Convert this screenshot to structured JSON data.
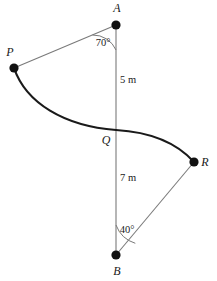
{
  "diagram": {
    "background_color": "#ffffff",
    "stroke_color": "#1a1a1a",
    "thin_stroke_color": "#6b6b6b",
    "points": [
      {
        "id": "A",
        "label": "A",
        "x": 116,
        "y": 25,
        "label_x": 117,
        "label_y": 12
      },
      {
        "id": "P",
        "label": "P",
        "x": 14,
        "y": 68,
        "label_x": 10,
        "label_y": 56
      },
      {
        "id": "Q",
        "label": "Q",
        "x": 116,
        "y": 130,
        "label_x": 106,
        "label_y": 144
      },
      {
        "id": "R",
        "label": "R",
        "x": 194,
        "y": 162,
        "label_x": 205,
        "label_y": 166
      },
      {
        "id": "B",
        "label": "B",
        "x": 116,
        "y": 255,
        "label_x": 117,
        "label_y": 275
      }
    ],
    "dimensions": [
      {
        "id": "AQ",
        "label": "5 m",
        "value": 5,
        "unit": "m",
        "x": 120,
        "y": 83
      },
      {
        "id": "QB",
        "label": "7 m",
        "value": 7,
        "unit": "m",
        "x": 120,
        "y": 181
      }
    ],
    "angles": [
      {
        "id": "angle-at-A",
        "label": "70°",
        "value": 70,
        "unit": "degree",
        "vertex": "A",
        "x": 103,
        "y": 46
      },
      {
        "id": "angle-at-B",
        "label": "40°",
        "value": 40,
        "unit": "degree",
        "vertex": "B",
        "x": 127,
        "y": 233
      }
    ],
    "segments": [
      {
        "id": "segment-AB",
        "from": "A",
        "to": "B",
        "style": "thin"
      },
      {
        "id": "segment-PA",
        "from": "P",
        "to": "A",
        "style": "thin"
      },
      {
        "id": "segment-BR",
        "from": "B",
        "to": "R",
        "style": "thin"
      }
    ],
    "curve": {
      "id": "reverse-curve-PQR",
      "from": "P",
      "through": "Q",
      "to": "R",
      "style": "thick",
      "path": "M 14 68 C 26 103 64 126 116 130 C 150 132 176 142 194 162"
    }
  }
}
